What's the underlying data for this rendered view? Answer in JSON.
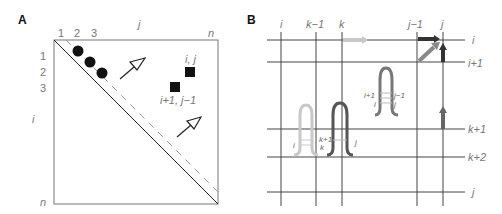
{
  "panel_a": {
    "label": "A",
    "top_axis": {
      "ticks": [
        "1",
        "2",
        "3"
      ],
      "var": "j",
      "end": "n"
    },
    "left_axis": {
      "ticks": [
        "1",
        "2",
        "3"
      ],
      "var": "i",
      "end": "n"
    },
    "cell_labels": {
      "upper": "i, j",
      "lower": "i+1, j−1"
    }
  },
  "panel_b": {
    "label": "B",
    "columns": [
      "i",
      "k−1",
      "k",
      "j−1",
      "j"
    ],
    "rows": [
      "i",
      "i+1",
      "k+1",
      "k+2",
      "j"
    ],
    "hairpin_center": {
      "left_top": "i+1",
      "left_bot": "i",
      "right_top": "j−1",
      "right_bot": "j"
    },
    "hairpin_left": {
      "left": "i",
      "mid_top": "k+1",
      "mid_bot": "k",
      "right": "j"
    }
  }
}
